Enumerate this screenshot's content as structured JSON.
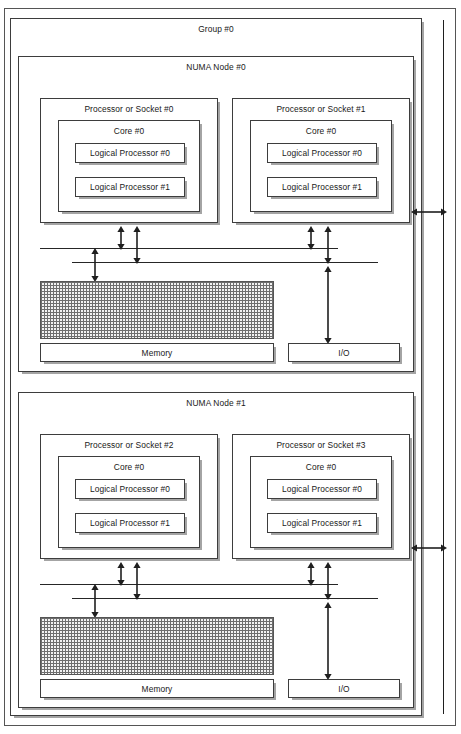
{
  "diagram": {
    "title": "Group #0",
    "type": "processor-topology-hierarchy",
    "group": {
      "label": "Group #0"
    },
    "nodes": [
      {
        "label": "NUMA Node #0",
        "sockets": [
          {
            "label": "Processor or Socket #0",
            "cores": [
              {
                "label": "Core #0",
                "logical_processors": [
                  {
                    "label": "Logical Processor #0"
                  },
                  {
                    "label": "Logical Processor #1"
                  }
                ]
              }
            ]
          },
          {
            "label": "Processor or Socket #1",
            "cores": [
              {
                "label": "Core #0",
                "logical_processors": [
                  {
                    "label": "Logical Processor #0"
                  },
                  {
                    "label": "Logical Processor #1"
                  }
                ]
              }
            ]
          }
        ],
        "memory": {
          "label": "Memory"
        },
        "io": {
          "label": "I/O"
        }
      },
      {
        "label": "NUMA Node #1",
        "sockets": [
          {
            "label": "Processor or Socket #2",
            "cores": [
              {
                "label": "Core #0",
                "logical_processors": [
                  {
                    "label": "Logical Processor #0"
                  },
                  {
                    "label": "Logical Processor #1"
                  }
                ]
              }
            ]
          },
          {
            "label": "Processor or Socket #3",
            "cores": [
              {
                "label": "Core #0",
                "logical_processors": [
                  {
                    "label": "Logical Processor #0"
                  },
                  {
                    "label": "Logical Processor #1"
                  }
                ]
              }
            ]
          }
        ],
        "memory": {
          "label": "Memory"
        },
        "io": {
          "label": "I/O"
        }
      }
    ],
    "colors": {
      "line": "#3d3d3d",
      "arrow": "#1f1f1f",
      "shadow": "#5a5a5a",
      "background": "#ffffff",
      "memory_hatch": "#6e6e6e"
    }
  }
}
